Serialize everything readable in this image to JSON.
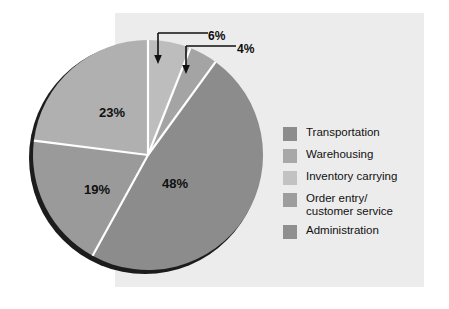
{
  "figure": {
    "panel_bg": "#ececec",
    "canvas_bg": "#ffffff",
    "shadow_color": "#1c1c1c",
    "separator_color": "#ffffff"
  },
  "chart_data": {
    "type": "pie",
    "title": "",
    "categories": [
      "Transportation",
      "Warehousing",
      "Inventory carrying",
      "Order entry/\ncustomer service",
      "Administration"
    ],
    "values": [
      48,
      23,
      19,
      6,
      4
    ],
    "labels": [
      "48%",
      "23%",
      "19%",
      "6%",
      "4%"
    ],
    "colors": [
      "#8c8c8c",
      "#b0b0b0",
      "#9a9a9a",
      "#bdbdbd",
      "#a4a4a4"
    ],
    "legend_position": "right",
    "grid": false,
    "start_angle_deg": 0,
    "direction": "clockwise",
    "slices": [
      {
        "name": "Inventory carrying",
        "label": "6%",
        "value": 6,
        "color": "#bdbdbd",
        "callout": true,
        "label_x": 208,
        "label_y": 29
      },
      {
        "name": "Order entry/customer service",
        "label": "4%",
        "value": 4,
        "color": "#a4a4a4",
        "callout": true,
        "label_x": 237,
        "label_y": 42
      },
      {
        "name": "Transportation",
        "label": "48%",
        "value": 48,
        "color": "#8c8c8c",
        "callout": false,
        "label_x": 162,
        "label_y": 176
      },
      {
        "name": "Administration",
        "label": "19%",
        "value": 19,
        "color": "#9a9a9a",
        "callout": false,
        "label_x": 84,
        "label_y": 182
      },
      {
        "name": "Warehousing",
        "label": "23%",
        "value": 23,
        "color": "#b0b0b0",
        "callout": false,
        "label_x": 99,
        "label_y": 105
      }
    ]
  },
  "legend": {
    "items": [
      {
        "label": "Transportation",
        "color": "#8c8c8c"
      },
      {
        "label": "Warehousing",
        "color": "#a8a8a8"
      },
      {
        "label": "Inventory carrying",
        "color": "#c2c2c2"
      },
      {
        "label": "Order entry/\ncustomer service",
        "color": "#9d9d9d"
      },
      {
        "label": "Administration",
        "color": "#8f8f8f"
      }
    ]
  }
}
